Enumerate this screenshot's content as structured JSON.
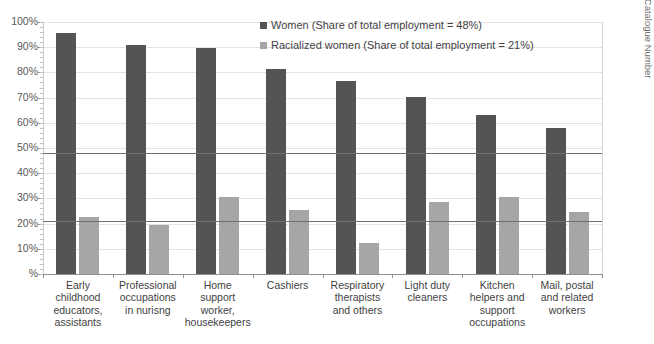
{
  "chart_data": {
    "type": "bar",
    "title": "",
    "xlabel": "",
    "ylabel": "%",
    "ylim": [
      0,
      100
    ],
    "grid": true,
    "legend_position": "top-right",
    "categories": [
      "Early childhood educators, assistants",
      "Professional occupations in nurisng",
      "Home support worker, housekeepers",
      "Cashiers",
      "Respiratory therapists and others",
      "Light duty cleaners",
      "Kitchen helpers and support occupations",
      "Mail, postal and related workers"
    ],
    "category_lines": [
      [
        "Early",
        "childhood",
        "educators,",
        "assistants"
      ],
      [
        "Professional",
        "occupations",
        "in nurisng"
      ],
      [
        "Home",
        "support",
        "worker,",
        "housekeepers"
      ],
      [
        "Cashiers"
      ],
      [
        "Respiratory",
        "therapists",
        "and others"
      ],
      [
        "Light duty",
        "cleaners"
      ],
      [
        "Kitchen",
        "helpers and",
        "support",
        "occupations"
      ],
      [
        "Mail, postal",
        "and related",
        "workers"
      ]
    ],
    "series": [
      {
        "name": "Women (Share of total employment = 48%)",
        "short_name": "Women",
        "color": "#545454",
        "values": [
          95.5,
          90.8,
          89.5,
          81.5,
          76.5,
          70.3,
          63.0,
          58.0
        ]
      },
      {
        "name": "Racialized women (Share of total employment = 21%)",
        "short_name": "Racialized women",
        "color": "#a6a6a6",
        "values": [
          22.5,
          19.5,
          30.5,
          25.5,
          12.5,
          28.5,
          30.5,
          24.5
        ]
      }
    ],
    "reference_lines": [
      {
        "label": "Women share of total employment",
        "value": 48,
        "color": "#707070"
      },
      {
        "label": "Racialized women share of total employment",
        "value": 21,
        "color": "#707070"
      }
    ],
    "ytick_labels": [
      "100%",
      "90%",
      "80%",
      "70%",
      "60%",
      "50%",
      "40%",
      "30%",
      "20%",
      "10%",
      "%"
    ],
    "ytick_values": [
      100,
      90,
      80,
      70,
      60,
      50,
      40,
      30,
      20,
      10,
      0
    ]
  },
  "legend": {
    "items": [
      {
        "label": "Women (Share of total employment = 48%)",
        "color": "#545454"
      },
      {
        "label": "Racialized women (Share of total employment = 21%)",
        "color": "#a6a6a6"
      }
    ]
  },
  "source": {
    "line1": "Statistics Canada (2016). Census, Catalogue Number",
    "line2": "98-400-X2016356."
  }
}
